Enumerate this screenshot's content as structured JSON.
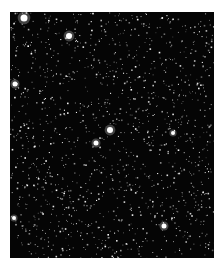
{
  "image": {
    "subject": "star field",
    "background_color": "#050505",
    "border_color": "#ffffff",
    "star_color": "#ffffff",
    "bright_stars": [
      {
        "x": 24,
        "y": 18,
        "r": 3.5
      },
      {
        "x": 69,
        "y": 36,
        "r": 3
      },
      {
        "x": 15,
        "y": 84,
        "r": 2.5
      },
      {
        "x": 110,
        "y": 130,
        "r": 3
      },
      {
        "x": 96,
        "y": 143,
        "r": 2.5
      },
      {
        "x": 173,
        "y": 133,
        "r": 2
      },
      {
        "x": 164,
        "y": 226,
        "r": 2.5
      },
      {
        "x": 14,
        "y": 218,
        "r": 2
      }
    ],
    "star_count_estimate": 1400
  }
}
